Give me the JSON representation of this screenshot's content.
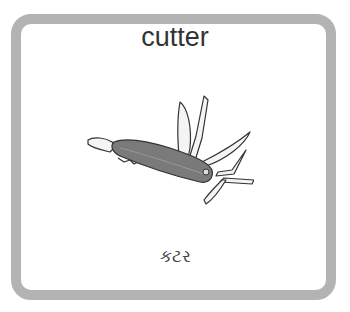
{
  "card": {
    "title": "cutter",
    "translation": "કટર",
    "image": "multi-tool-pocket-knife-icon",
    "border_color": "#b3b3b3"
  }
}
